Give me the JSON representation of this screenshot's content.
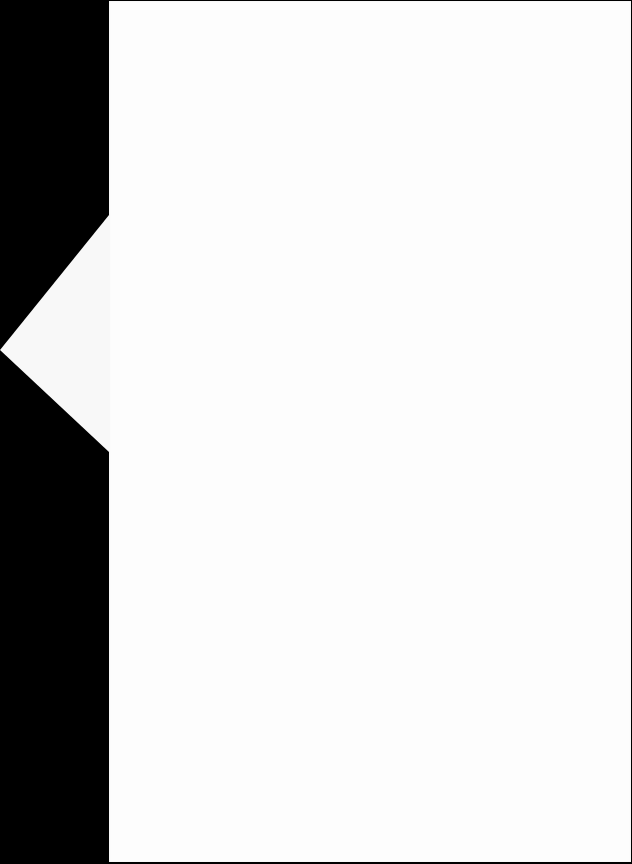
{
  "document": {
    "description": "Blank white paper sheet on black background",
    "text_content": "",
    "colors": {
      "background": "#000000",
      "paper": "#fdfdfd"
    }
  }
}
